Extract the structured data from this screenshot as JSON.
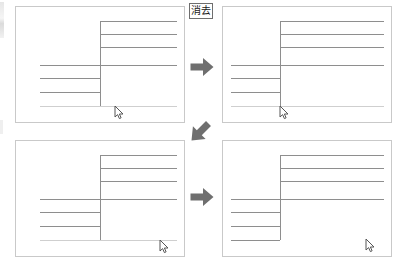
{
  "document": {
    "title": "消去",
    "description": "Four-panel before/after sequence of a line drawing with an erase (消去) operation"
  },
  "label": {
    "text": "消去",
    "meaning": "erase",
    "x": 189,
    "y": 3,
    "w": 24,
    "h": 16
  },
  "colors": {
    "page_background": "#ffffff",
    "panel_background": "#ffffff",
    "panel_border": "#c9c9c9",
    "stroke": "#8e8e8e",
    "stroke_faint": "#cfcfcf",
    "arrow": "#6f6f6f",
    "label_border": "#6e6e6e",
    "label_text": "#1a1a1a"
  },
  "panels": [
    {
      "name": "panel-top-left",
      "step": 1,
      "x": 15,
      "y": 6,
      "w": 170,
      "h": 117,
      "vline": {
        "x_pct": 50.0,
        "y1_pct": 12.0,
        "y2_pct": 86.5
      },
      "hlines": [
        {
          "x1_pct": 50.0,
          "x2_pct": 96.0,
          "y_pct": 12.0,
          "faint": false
        },
        {
          "x1_pct": 50.0,
          "x2_pct": 96.0,
          "y_pct": 23.5,
          "faint": false
        },
        {
          "x1_pct": 50.0,
          "x2_pct": 96.0,
          "y_pct": 35.0,
          "faint": false
        },
        {
          "x1_pct": 14.0,
          "x2_pct": 96.0,
          "y_pct": 50.0,
          "faint": false
        },
        {
          "x1_pct": 14.0,
          "x2_pct": 50.0,
          "y_pct": 62.0,
          "faint": false
        },
        {
          "x1_pct": 14.0,
          "x2_pct": 50.0,
          "y_pct": 74.0,
          "faint": false
        },
        {
          "x1_pct": 14.0,
          "x2_pct": 96.0,
          "y_pct": 86.5,
          "faint": true
        }
      ],
      "cursor": {
        "x_pct": 59.0,
        "y_pct": 86.0
      }
    },
    {
      "name": "panel-top-right",
      "step": 2,
      "x": 222,
      "y": 6,
      "w": 170,
      "h": 117,
      "vline": {
        "x_pct": 34.0,
        "y1_pct": 12.0,
        "y2_pct": 86.5
      },
      "hlines": [
        {
          "x1_pct": 34.0,
          "x2_pct": 96.0,
          "y_pct": 12.0,
          "faint": false
        },
        {
          "x1_pct": 34.0,
          "x2_pct": 96.0,
          "y_pct": 23.5,
          "faint": false
        },
        {
          "x1_pct": 34.0,
          "x2_pct": 96.0,
          "y_pct": 35.0,
          "faint": false
        },
        {
          "x1_pct": 5.0,
          "x2_pct": 96.0,
          "y_pct": 50.0,
          "faint": false
        },
        {
          "x1_pct": 5.0,
          "x2_pct": 34.0,
          "y_pct": 62.0,
          "faint": false
        },
        {
          "x1_pct": 5.0,
          "x2_pct": 34.0,
          "y_pct": 74.0,
          "faint": false
        },
        {
          "x1_pct": 5.0,
          "x2_pct": 96.0,
          "y_pct": 86.5,
          "faint": true
        }
      ],
      "cursor": {
        "x_pct": 34.0,
        "y_pct": 86.0
      }
    },
    {
      "name": "panel-bottom-left",
      "step": 3,
      "x": 15,
      "y": 140,
      "w": 170,
      "h": 117,
      "vline": {
        "x_pct": 50.0,
        "y1_pct": 12.0,
        "y2_pct": 86.5
      },
      "hlines": [
        {
          "x1_pct": 50.0,
          "x2_pct": 96.0,
          "y_pct": 12.0,
          "faint": false
        },
        {
          "x1_pct": 50.0,
          "x2_pct": 96.0,
          "y_pct": 23.5,
          "faint": false
        },
        {
          "x1_pct": 50.0,
          "x2_pct": 96.0,
          "y_pct": 35.0,
          "faint": false
        },
        {
          "x1_pct": 14.0,
          "x2_pct": 96.0,
          "y_pct": 50.0,
          "faint": false
        },
        {
          "x1_pct": 14.0,
          "x2_pct": 50.0,
          "y_pct": 62.0,
          "faint": false
        },
        {
          "x1_pct": 14.0,
          "x2_pct": 50.0,
          "y_pct": 74.0,
          "faint": false
        },
        {
          "x1_pct": 14.0,
          "x2_pct": 96.0,
          "y_pct": 86.5,
          "faint": true
        }
      ],
      "cursor": {
        "x_pct": 86.0,
        "y_pct": 86.0
      }
    },
    {
      "name": "panel-bottom-right",
      "step": 4,
      "x": 222,
      "y": 140,
      "w": 170,
      "h": 117,
      "vline": {
        "x_pct": 34.0,
        "y1_pct": 12.0,
        "y2_pct": 86.5
      },
      "hlines": [
        {
          "x1_pct": 34.0,
          "x2_pct": 96.0,
          "y_pct": 12.0,
          "faint": false
        },
        {
          "x1_pct": 34.0,
          "x2_pct": 96.0,
          "y_pct": 23.5,
          "faint": false
        },
        {
          "x1_pct": 34.0,
          "x2_pct": 96.0,
          "y_pct": 35.0,
          "faint": false
        },
        {
          "x1_pct": 5.0,
          "x2_pct": 96.0,
          "y_pct": 50.0,
          "faint": false
        },
        {
          "x1_pct": 5.0,
          "x2_pct": 34.0,
          "y_pct": 62.0,
          "faint": false
        },
        {
          "x1_pct": 5.0,
          "x2_pct": 34.0,
          "y_pct": 74.0,
          "faint": false
        },
        {
          "x1_pct": 5.0,
          "x2_pct": 34.0,
          "y_pct": 86.5,
          "faint": false
        }
      ],
      "cursor": {
        "x_pct": 85.0,
        "y_pct": 85.0
      }
    }
  ],
  "arrows": [
    {
      "name": "arrow-right-top",
      "direction": "right",
      "x": 189,
      "y": 54,
      "size": 26
    },
    {
      "name": "arrow-down-left",
      "direction": "down-left",
      "x": 186,
      "y": 118,
      "size": 28
    },
    {
      "name": "arrow-right-bottom",
      "direction": "right",
      "x": 189,
      "y": 184,
      "size": 26
    }
  ]
}
